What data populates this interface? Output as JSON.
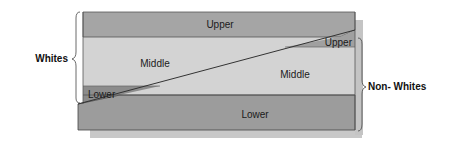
{
  "diagram": {
    "groups": {
      "whites": {
        "label": "Whites"
      },
      "non_whites": {
        "label": "Non- Whites"
      }
    },
    "whites_layers": [
      {
        "label": "Upper"
      },
      {
        "label": "Middle"
      },
      {
        "label": "Lower"
      }
    ],
    "non_whites_layers": [
      {
        "label": "Upper"
      },
      {
        "label": "Middle"
      },
      {
        "label": "Lower"
      }
    ],
    "colors": {
      "upper_band": "#a3a3a3",
      "middle_band": "#d2d2d2",
      "lower_band": "#9a9a9a",
      "wedge_dark": "#8a8a8a",
      "shadow": "#c4c4c4",
      "line": "#333333"
    }
  }
}
